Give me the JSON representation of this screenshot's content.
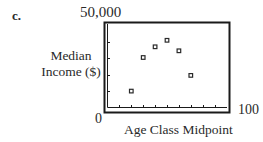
{
  "figure": {
    "part_label": "c.",
    "y_max_label": "50,000",
    "y_min_label": "0",
    "x_max_label": "100",
    "y_axis_label_line1": "Median",
    "y_axis_label_line2": "Income ($)",
    "x_axis_label": "Age Class Midpoint"
  },
  "colors": {
    "frame": "#1a1a1a",
    "marker": "#2a2a2a",
    "text": "#2a2a2a",
    "background": "#ffffff"
  },
  "chart_data": {
    "type": "scatter",
    "title": "",
    "panel_label": "c.",
    "xlabel": "Age Class Midpoint",
    "ylabel": "Median Income ($)",
    "xlim": [
      0,
      100
    ],
    "ylim": [
      0,
      50000
    ],
    "x_tick_step": 10,
    "y_tick_step": 10000,
    "x_tick_labels_shown": [
      "0",
      "100"
    ],
    "y_tick_labels_shown": [
      "0",
      "50,000"
    ],
    "grid": false,
    "legend": null,
    "marker": "hollow-square",
    "series": [
      {
        "name": "Median Income",
        "x": [
          20,
          30,
          40,
          50,
          60,
          70
        ],
        "y": [
          10000,
          30500,
          37000,
          41000,
          34600,
          19600
        ]
      }
    ]
  }
}
